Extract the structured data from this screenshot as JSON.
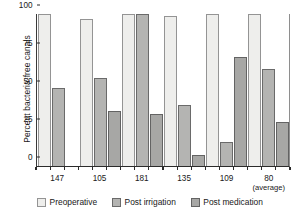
{
  "chart_data": {
    "type": "bar",
    "title": "",
    "xlabel": "",
    "ylabel": "Percent bacteria-free canals",
    "ylim": [
      0,
      100
    ],
    "yticks": [
      0,
      25,
      50,
      75,
      100
    ],
    "grid": false,
    "legend_position": "bottom",
    "categories": [
      "147",
      "105",
      "181",
      "135",
      "109",
      "80"
    ],
    "category_sublabels": [
      "",
      "",
      "",
      "",
      "",
      "(average)"
    ],
    "series": [
      {
        "name": "Preoperative",
        "color": "#eeeeec",
        "values": [
          100,
          97,
          100,
          99,
          100,
          100
        ]
      },
      {
        "name": "Post irrigation",
        "color": "#b4b4b2",
        "values": [
          51,
          58,
          100,
          40,
          16,
          64
        ]
      },
      {
        "name": "Post medication",
        "color": "#a7a7a5",
        "values": [
          0,
          36,
          34,
          7,
          72,
          29
        ]
      }
    ]
  },
  "legend": {
    "items": [
      {
        "label": "Preoperative"
      },
      {
        "label": "Post irrigation"
      },
      {
        "label": "Post medication"
      }
    ]
  }
}
